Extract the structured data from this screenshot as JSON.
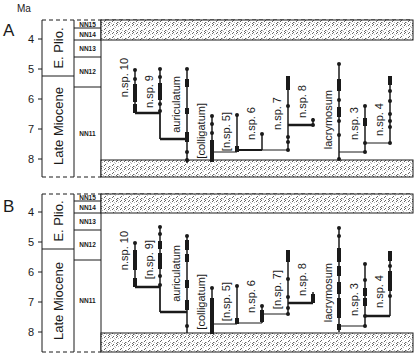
{
  "figure": {
    "axis_unit": "Ma",
    "colors": {
      "ink": "#1a1a1a",
      "background": "#ffffff",
      "hatch": "#555555"
    },
    "panels": [
      {
        "id": "A",
        "label": "A",
        "ticks": [
          "4",
          "5",
          "6",
          "7",
          "8"
        ],
        "epochs": [
          {
            "label": "E. Plio.",
            "from": 3.55,
            "to": 5.25
          },
          {
            "label": "Late Miocene",
            "from": 5.25,
            "to": 8.6
          }
        ],
        "zones": [
          {
            "label": "NN15",
            "from": 3.55,
            "to": 3.8
          },
          {
            "label": "NN14",
            "from": 3.8,
            "to": 4.15
          },
          {
            "label": "NN13",
            "from": 4.15,
            "to": 4.6
          },
          {
            "label": "NN12",
            "from": 4.6,
            "to": 5.6
          },
          {
            "label": "NN11",
            "from": 5.6,
            "to": 8.6
          }
        ],
        "taxa": [
          {
            "name": "n.sp. 10",
            "x": 135,
            "top": 5.1,
            "bottom": 6.5
          },
          {
            "name": "n.sp. 9",
            "x": 160,
            "top": 5.05,
            "bottom": 6.5
          },
          {
            "name": "auriculatum",
            "x": 187,
            "top": 5.05,
            "bottom": 8.0
          },
          {
            "name": "[colligatum]",
            "x": 212,
            "top": 6.6,
            "bottom": 8.05
          },
          {
            "name": "[n.sp. 5]",
            "x": 237,
            "top": 6.6,
            "bottom": 7.7
          },
          {
            "name": "n.sp. 6",
            "x": 262,
            "top": 7.3,
            "bottom": 7.55
          },
          {
            "name": "n.sp. 7",
            "x": 288,
            "top": 5.35,
            "bottom": 7.5
          },
          {
            "name": "n.sp. 8",
            "x": 313,
            "top": 6.5,
            "bottom": 6.85
          },
          {
            "name": "lacrymosum",
            "x": 339,
            "top": 4.9,
            "bottom": 8.0
          },
          {
            "name": "n.sp. 3",
            "x": 365,
            "top": 6.5,
            "bottom": 7.8
          },
          {
            "name": "n.sp. 4",
            "x": 390,
            "top": 5.25,
            "bottom": 7.5
          }
        ]
      },
      {
        "id": "B",
        "label": "B",
        "ticks": [
          "4",
          "5",
          "6",
          "7",
          "8"
        ],
        "epochs": [
          {
            "label": "E. Plio.",
            "from": 3.4,
            "to": 5.25
          },
          {
            "label": "Late Miocene",
            "from": 5.25,
            "to": 8.65
          }
        ],
        "zones": [
          {
            "label": "NN15",
            "from": 3.4,
            "to": 3.65
          },
          {
            "label": "NN14",
            "from": 3.65,
            "to": 4.0
          },
          {
            "label": "NN13",
            "from": 4.0,
            "to": 4.6
          },
          {
            "label": "NN12",
            "from": 4.6,
            "to": 5.6
          },
          {
            "label": "NN11",
            "from": 5.6,
            "to": 8.65
          }
        ],
        "taxa": [
          {
            "name": "n.sp. 10",
            "x": 135,
            "top": 5.25,
            "bottom": 6.45
          },
          {
            "name": "[n.sp. 9]",
            "x": 160,
            "top": 4.7,
            "bottom": 6.45
          },
          {
            "name": "auriculatum",
            "x": 187,
            "top": 5.15,
            "bottom": 8.0
          },
          {
            "name": "[colligatum]",
            "x": 212,
            "top": 6.6,
            "bottom": 8.05
          },
          {
            "name": "[n.sp. 5]",
            "x": 237,
            "top": 6.6,
            "bottom": 7.75
          },
          {
            "name": "n.sp. 6",
            "x": 262,
            "top": 7.3,
            "bottom": 7.6
          },
          {
            "name": "[n.sp. 7]",
            "x": 288,
            "top": 5.35,
            "bottom": 7.6
          },
          {
            "name": "n.sp. 8",
            "x": 313,
            "top": 6.7,
            "bottom": 7.05
          },
          {
            "name": "lacrymosum",
            "x": 339,
            "top": 4.9,
            "bottom": 8.0
          },
          {
            "name": "n.sp. 3",
            "x": 365,
            "top": 6.4,
            "bottom": 7.8
          },
          {
            "name": "n.sp. 4",
            "x": 390,
            "top": 5.3,
            "bottom": 7.3
          }
        ]
      }
    ]
  }
}
